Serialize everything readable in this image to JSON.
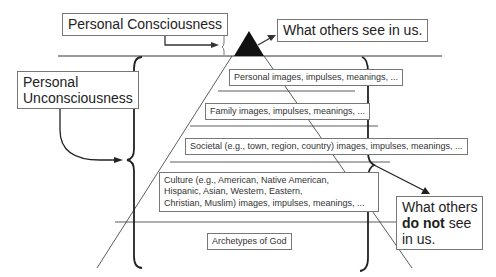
{
  "title_boxes": {
    "personal_consciousness": "Personal Consciousness",
    "what_others_see": "What others see in us.",
    "personal_unconsciousness_line1": "Personal",
    "personal_unconsciousness_line2": "Unconsciousness",
    "not_see_line1": "What others",
    "not_see_bold": "do not",
    "not_see_rest": "see",
    "not_see_line3": "in us."
  },
  "layers": [
    {
      "label": "Personal images, impulses, meanings, ..."
    },
    {
      "label": "Family images, impulses, meanings, ..."
    },
    {
      "label": "Societal (e.g., town, region, country) images, impulses, meanings, ..."
    },
    {
      "label_lines": [
        "Culture (e.g., American, Native American,",
        "Hispanic, Asian, Western, Eastern,",
        "Christian, Muslim) images, impulses, meanings, ..."
      ]
    },
    {
      "label": "Archetypes of God"
    }
  ],
  "colors": {
    "line": "#333333",
    "apex": "#111111",
    "box_border": "#777777"
  }
}
